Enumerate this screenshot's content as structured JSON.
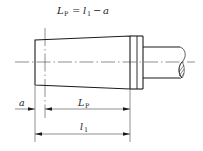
{
  "diagram": {
    "type": "engineering-drawing",
    "formula": {
      "lhs_symbol": "L",
      "lhs_subscript": "P",
      "equals": "=",
      "term1_symbol": "l",
      "term1_subscript": "1",
      "minus": "−",
      "term2_symbol": "a",
      "full_text": "L_P = l_1 − a"
    },
    "dimensions": [
      {
        "id": "a",
        "symbol": "a",
        "subscript": ""
      },
      {
        "id": "L_P",
        "symbol": "L",
        "subscript": "P"
      },
      {
        "id": "l_1",
        "symbol": "l",
        "subscript": "1"
      }
    ],
    "colors": {
      "line": "#1a1a1a",
      "thin_line": "#444444",
      "background": "#ffffff"
    }
  }
}
